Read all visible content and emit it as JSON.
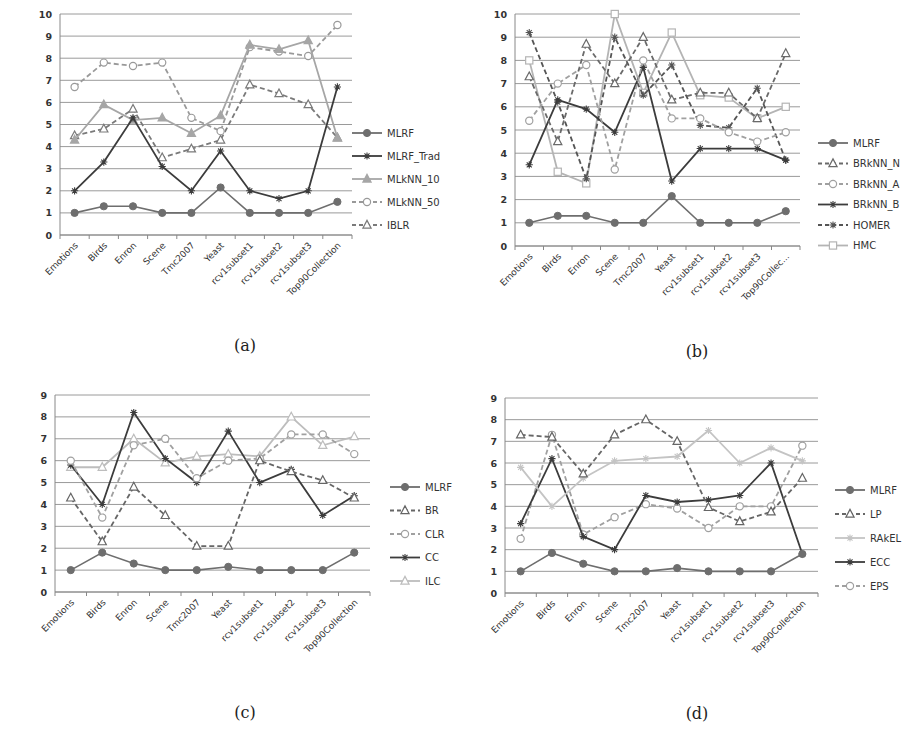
{
  "chart_data": [
    {
      "type": "line",
      "caption": "(a)",
      "categories": [
        "Emotions",
        "Birds",
        "Enron",
        "Scene",
        "Tmc2007",
        "Yeast",
        "rcv1subset1",
        "rcv1subset2",
        "rcv1subset3",
        "Top90Collection"
      ],
      "ylim": [
        0,
        10
      ],
      "yticks": [
        0,
        1,
        2,
        3,
        4,
        5,
        6,
        7,
        8,
        9,
        10
      ],
      "grid": true,
      "legend": "right",
      "series": [
        {
          "name": "MLRF",
          "style": "solid",
          "marker": "circle-filled",
          "color": "#6e6e6e",
          "values": [
            1,
            1.3,
            1.3,
            1,
            1,
            2.15,
            1,
            1,
            1,
            1.5
          ]
        },
        {
          "name": "MLRF_Trad",
          "style": "solid",
          "marker": "star",
          "color": "#3c3c3c",
          "values": [
            2,
            3.3,
            5.3,
            3.1,
            2,
            3.8,
            2,
            1.65,
            2,
            6.7
          ]
        },
        {
          "name": "MLkNN_10",
          "style": "solid",
          "marker": "triangle-filled",
          "color": "#a6a6a6",
          "values": [
            4.3,
            5.9,
            5.2,
            5.3,
            4.6,
            5.4,
            8.6,
            8.4,
            8.8,
            4.4
          ]
        },
        {
          "name": "MLkNN_50",
          "style": "dashed",
          "marker": "circle-open",
          "color": "#999999",
          "values": [
            6.7,
            7.8,
            7.65,
            7.8,
            5.3,
            4.7,
            8.5,
            8.3,
            8.1,
            9.5
          ]
        },
        {
          "name": "IBLR",
          "style": "dashed",
          "marker": "triangle-open",
          "color": "#7a7a7a",
          "values": [
            4.5,
            4.8,
            5.7,
            3.5,
            3.9,
            4.3,
            6.8,
            6.4,
            5.9,
            4.4
          ]
        }
      ]
    },
    {
      "type": "line",
      "caption": "(b)",
      "categories": [
        "Emotions",
        "Birds",
        "Enron",
        "Scene",
        "Tmc2007",
        "Yeast",
        "rcv1subset1",
        "rcv1subset2",
        "rcv1subset3",
        "Top90Collec..."
      ],
      "ylim": [
        0,
        10
      ],
      "yticks": [
        0,
        1,
        2,
        3,
        4,
        5,
        6,
        7,
        8,
        9,
        10
      ],
      "grid": true,
      "legend": "right",
      "series": [
        {
          "name": "MLRF",
          "style": "solid",
          "marker": "circle-filled",
          "color": "#6e6e6e",
          "values": [
            1,
            1.3,
            1.3,
            1,
            1,
            2.15,
            1,
            1,
            1,
            1.5
          ]
        },
        {
          "name": "BRkNN_N",
          "style": "dashed",
          "marker": "triangle-open",
          "color": "#6a6a6a",
          "values": [
            7.3,
            4.5,
            8.7,
            7.0,
            9.0,
            6.3,
            6.6,
            6.6,
            5.5,
            8.3
          ]
        },
        {
          "name": "BRkNN_A",
          "style": "dashed",
          "marker": "circle-open",
          "color": "#a0a0a0",
          "values": [
            5.4,
            7.0,
            7.8,
            3.3,
            8.0,
            5.5,
            5.5,
            4.9,
            4.5,
            4.9
          ]
        },
        {
          "name": "BRkNN_B",
          "style": "solid",
          "marker": "star",
          "color": "#3c3c3c",
          "values": [
            3.5,
            6.3,
            5.9,
            4.9,
            7.7,
            2.8,
            4.2,
            4.2,
            4.2,
            3.7
          ]
        },
        {
          "name": "HOMER",
          "style": "dashed",
          "marker": "star",
          "color": "#555555",
          "values": [
            9.2,
            6.2,
            2.9,
            9.0,
            6.5,
            7.8,
            5.2,
            5.1,
            6.8,
            3.7
          ]
        },
        {
          "name": "HMC",
          "style": "solid",
          "marker": "square-open",
          "color": "#b4b4b4",
          "values": [
            8.0,
            3.2,
            2.7,
            10.0,
            6.6,
            9.2,
            6.5,
            6.4,
            5.5,
            6.0
          ]
        }
      ]
    },
    {
      "type": "line",
      "caption": "(c)",
      "categories": [
        "Emotions",
        "Birds",
        "Enron",
        "Scene",
        "Tmc2007",
        "Yeast",
        "rcv1subset1",
        "rcv1subset2",
        "rcv1subset3",
        "Top90Collection"
      ],
      "ylim": [
        0,
        9
      ],
      "yticks": [
        0,
        1,
        2,
        3,
        4,
        5,
        6,
        7,
        8,
        9
      ],
      "grid": true,
      "legend": "right",
      "series": [
        {
          "name": "MLRF",
          "style": "solid",
          "marker": "circle-filled",
          "color": "#6e6e6e",
          "values": [
            1,
            1.8,
            1.3,
            1,
            1,
            1.15,
            1,
            1,
            1,
            1.8
          ]
        },
        {
          "name": "BR",
          "style": "dashed",
          "marker": "triangle-open",
          "color": "#666666",
          "values": [
            4.3,
            2.3,
            4.8,
            3.5,
            2.1,
            2.1,
            6.0,
            5.5,
            5.1,
            4.3
          ]
        },
        {
          "name": "CLR",
          "style": "dashed",
          "marker": "circle-open",
          "color": "#a0a0a0",
          "values": [
            6.0,
            3.4,
            6.7,
            7.0,
            5.2,
            6.0,
            6.1,
            7.2,
            7.2,
            6.3
          ]
        },
        {
          "name": "CC",
          "style": "solid",
          "marker": "star",
          "color": "#3c3c3c",
          "values": [
            5.8,
            4.0,
            8.2,
            6.1,
            5.0,
            7.35,
            5.0,
            5.6,
            3.5,
            4.4
          ]
        },
        {
          "name": "ILC",
          "style": "solid",
          "marker": "triangle-open",
          "color": "#bdbdbd",
          "values": [
            5.7,
            5.7,
            7.0,
            5.9,
            6.2,
            6.3,
            6.2,
            8.0,
            6.7,
            7.1
          ]
        }
      ]
    },
    {
      "type": "line",
      "caption": "(d)",
      "categories": [
        "Emotions",
        "Birds",
        "Enron",
        "Scene",
        "Tmc2007",
        "Yeast",
        "rcv1subset1",
        "rcv1subset2",
        "rcv1subset3",
        "Top90Collection"
      ],
      "ylim": [
        0,
        9
      ],
      "yticks": [
        0,
        1,
        2,
        3,
        4,
        5,
        6,
        7,
        8,
        9
      ],
      "grid": true,
      "legend": "right",
      "series": [
        {
          "name": "MLRF",
          "style": "solid",
          "marker": "circle-filled",
          "color": "#6e6e6e",
          "values": [
            1,
            1.85,
            1.35,
            1,
            1,
            1.15,
            1,
            1,
            1,
            1.8
          ]
        },
        {
          "name": "LP",
          "style": "dashed",
          "marker": "triangle-open",
          "color": "#666666",
          "values": [
            7.3,
            7.2,
            5.5,
            7.3,
            8.0,
            7.0,
            3.95,
            3.3,
            3.75,
            5.3
          ]
        },
        {
          "name": "RAkEL",
          "style": "solid",
          "marker": "star",
          "color": "#c4c4c4",
          "values": [
            5.8,
            4.0,
            5.3,
            6.1,
            6.2,
            6.3,
            7.5,
            6.0,
            6.7,
            6.1
          ]
        },
        {
          "name": "ECC",
          "style": "solid",
          "marker": "star",
          "color": "#3c3c3c",
          "values": [
            3.2,
            6.2,
            2.6,
            2.0,
            4.5,
            4.2,
            4.3,
            4.5,
            6.0,
            1.8
          ]
        },
        {
          "name": "EPS",
          "style": "dashed",
          "marker": "circle-open",
          "color": "#a0a0a0",
          "values": [
            2.5,
            7.3,
            2.7,
            3.5,
            4.1,
            3.9,
            3.0,
            4.0,
            4.0,
            6.8
          ]
        }
      ]
    }
  ]
}
